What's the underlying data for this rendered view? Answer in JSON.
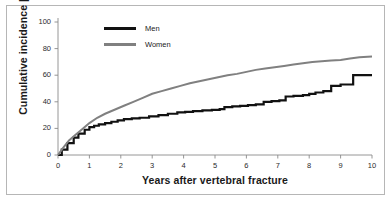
{
  "chart_data": {
    "type": "line",
    "title": "",
    "subtitle": "",
    "xlabel": "Years after vertebral fracture",
    "ylabel": "Cumulative incidence [%]",
    "xlim": [
      0,
      10
    ],
    "ylim": [
      0,
      100
    ],
    "xticks": [
      "0",
      "1",
      "2",
      "3",
      "4",
      "5",
      "6",
      "7",
      "8",
      "9",
      "10"
    ],
    "yticks": [
      "0",
      "20",
      "40",
      "60",
      "80",
      "100"
    ],
    "grid": false,
    "legend_position": "top-left-inside",
    "series": [
      {
        "name": "Men",
        "color": "#111111",
        "style": "step",
        "x": [
          0,
          0.12,
          0.3,
          0.5,
          0.65,
          0.85,
          1.0,
          1.15,
          1.3,
          1.5,
          1.7,
          1.9,
          2.1,
          2.35,
          2.6,
          2.9,
          3.2,
          3.5,
          3.8,
          4.05,
          4.3,
          4.6,
          4.9,
          5.15,
          5.3,
          5.55,
          5.8,
          6.05,
          6.3,
          6.55,
          6.8,
          7.05,
          7.25,
          7.5,
          7.8,
          8.0,
          8.2,
          8.45,
          8.7,
          9.0,
          9.4,
          10.0
        ],
        "y": [
          0,
          4,
          9,
          13,
          16,
          19,
          21,
          22,
          23,
          24,
          25,
          26,
          27,
          27.5,
          28,
          29,
          30,
          31,
          32,
          32.5,
          33,
          33.5,
          34,
          34.5,
          36,
          36.5,
          37,
          37.5,
          38,
          40,
          40.5,
          41,
          44,
          44.5,
          45,
          46,
          47,
          48,
          52,
          53,
          60,
          60
        ]
      },
      {
        "name": "Women",
        "color": "#808080",
        "style": "line",
        "x": [
          0,
          0.15,
          0.35,
          0.55,
          0.75,
          1.0,
          1.25,
          1.5,
          1.8,
          2.1,
          2.4,
          2.7,
          3.0,
          3.3,
          3.6,
          3.9,
          4.2,
          4.5,
          4.8,
          5.1,
          5.4,
          5.7,
          6.0,
          6.3,
          6.6,
          6.9,
          7.2,
          7.5,
          7.8,
          8.1,
          8.4,
          8.7,
          9.0,
          9.3,
          9.6,
          10.0
        ],
        "y": [
          0,
          5,
          11,
          15,
          19,
          24,
          28,
          31,
          34,
          37,
          40,
          43,
          46,
          48,
          50,
          52,
          54,
          55.5,
          57,
          58.5,
          60,
          61,
          62.5,
          64,
          65,
          66,
          67,
          68,
          69,
          70,
          70.5,
          71,
          71.5,
          72.5,
          73.5,
          74
        ]
      }
    ],
    "annotations": []
  },
  "legend": {
    "entries": [
      {
        "label": "Men",
        "color": "#111111"
      },
      {
        "label": "Women",
        "color": "#808080"
      }
    ]
  },
  "axes": {
    "axis_color": "#8a8a8a",
    "text_color": "#1a1a1a"
  },
  "frame": {
    "border_color": "#b6b6b6"
  }
}
